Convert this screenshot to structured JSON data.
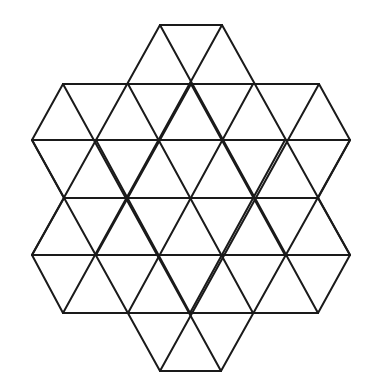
{
  "diagram": {
    "type": "triangular-grid-hexagram",
    "background": "#ffffff",
    "stroke_color": "#1a1a1a",
    "stroke_width": 2,
    "rows": [
      {
        "y": 25,
        "xs": [
          160,
          222
        ]
      },
      {
        "y": 84,
        "xs": [
          63,
          128,
          191,
          253,
          319
        ]
      },
      {
        "y": 140,
        "xs": [
          32,
          96,
          160,
          222,
          285,
          350
        ]
      },
      {
        "y": 198,
        "xs": [
          64,
          127,
          191,
          254,
          318
        ]
      },
      {
        "y": 255,
        "xs": [
          32,
          96,
          160,
          222,
          285,
          350
        ]
      },
      {
        "y": 313,
        "xs": [
          63,
          128,
          190,
          253,
          318
        ]
      },
      {
        "y": 371,
        "xs": [
          160,
          221
        ]
      }
    ],
    "horizontal_segments": [
      [
        [
          160,
          25
        ],
        [
          222,
          25
        ]
      ],
      [
        [
          63,
          84
        ],
        [
          319,
          84
        ]
      ],
      [
        [
          32,
          140
        ],
        [
          350,
          140
        ]
      ],
      [
        [
          64,
          198
        ],
        [
          318,
          198
        ]
      ],
      [
        [
          32,
          255
        ],
        [
          350,
          255
        ]
      ],
      [
        [
          63,
          313
        ],
        [
          318,
          313
        ]
      ],
      [
        [
          160,
          371
        ],
        [
          221,
          371
        ]
      ]
    ],
    "diagonal_segments": [
      [
        [
          160,
          25
        ],
        [
          32,
          255
        ]
      ],
      [
        [
          222,
          25
        ],
        [
          63,
          313
        ]
      ],
      [
        [
          63,
          84
        ],
        [
          32,
          140
        ]
      ],
      [
        [
          191,
          84
        ],
        [
          96,
          255
        ]
      ],
      [
        [
          253,
          84
        ],
        [
          128,
          313
        ]
      ],
      [
        [
          319,
          84
        ],
        [
          160,
          371
        ]
      ],
      [
        [
          350,
          140
        ],
        [
          221,
          371
        ]
      ],
      [
        [
          285,
          140
        ],
        [
          190,
          313
        ]
      ],
      [
        [
          350,
          255
        ],
        [
          318,
          313
        ]
      ],
      [
        [
          222,
          25
        ],
        [
          350,
          255
        ]
      ],
      [
        [
          160,
          25
        ],
        [
          318,
          313
        ]
      ],
      [
        [
          319,
          84
        ],
        [
          350,
          140
        ]
      ],
      [
        [
          191,
          84
        ],
        [
          285,
          255
        ]
      ],
      [
        [
          128,
          84
        ],
        [
          253,
          313
        ]
      ],
      [
        [
          63,
          84
        ],
        [
          221,
          371
        ]
      ],
      [
        [
          32,
          140
        ],
        [
          160,
          371
        ]
      ],
      [
        [
          96,
          140
        ],
        [
          190,
          313
        ]
      ],
      [
        [
          32,
          255
        ],
        [
          63,
          313
        ]
      ],
      [
        [
          32,
          140
        ],
        [
          64,
          198
        ]
      ],
      [
        [
          64,
          198
        ],
        [
          32,
          255
        ]
      ],
      [
        [
          350,
          140
        ],
        [
          318,
          198
        ]
      ],
      [
        [
          318,
          198
        ],
        [
          350,
          255
        ]
      ]
    ]
  }
}
